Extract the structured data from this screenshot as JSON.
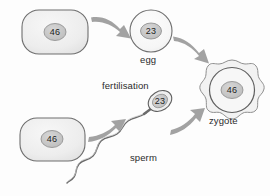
{
  "figure": {
    "background_color": "#fdfdfd",
    "stroke_color": "#6e6e6e",
    "arrow_color": "#9a9a9a",
    "cell_fill": "#efefef",
    "nucleus_fill": "#c8c8c8",
    "text_color": "#2b2b2b"
  },
  "labels": {
    "egg": "egg",
    "sperm": "sperm",
    "zygote": "zygote",
    "fertilisation": "fertilisation"
  },
  "chromosome_counts": {
    "mother_cell": "46",
    "egg": "23",
    "father_cell": "46",
    "sperm": "23",
    "zygote": "46"
  },
  "nodes": [
    {
      "id": "mother-cell",
      "name": "mother-parent-cell",
      "shape": "rounded-rectangle",
      "value": "46",
      "label": "",
      "cx": 55,
      "cy": 32
    },
    {
      "id": "egg-cell",
      "name": "egg-cell",
      "shape": "circle",
      "value": "23",
      "label": "egg",
      "cx": 151,
      "cy": 31
    },
    {
      "id": "father-cell",
      "name": "father-parent-cell",
      "shape": "rounded-rectangle",
      "value": "46",
      "label": "",
      "cx": 52,
      "cy": 139
    },
    {
      "id": "sperm-cell",
      "name": "sperm-cell",
      "shape": "sperm",
      "value": "23",
      "label": "sperm",
      "cx": 152,
      "cy": 107
    },
    {
      "id": "zygote-cell",
      "name": "zygote-cell",
      "shape": "scalloped-circle",
      "value": "46",
      "label": "zygote",
      "cx": 232,
      "cy": 93
    }
  ],
  "arrows": [
    {
      "id": "arrow-mother-to-egg",
      "name": "arrow-mother-to-egg",
      "from": "mother-cell",
      "to": "egg-cell"
    },
    {
      "id": "arrow-egg-to-zygote",
      "name": "arrow-egg-to-zygote",
      "from": "egg-cell",
      "to": "zygote-cell"
    },
    {
      "id": "arrow-father-to-sperm",
      "name": "arrow-father-to-sperm",
      "from": "father-cell",
      "to": "sperm-cell"
    },
    {
      "id": "arrow-sperm-to-zygote",
      "name": "arrow-sperm-to-zygote",
      "from": "sperm-cell",
      "to": "zygote-cell"
    }
  ]
}
